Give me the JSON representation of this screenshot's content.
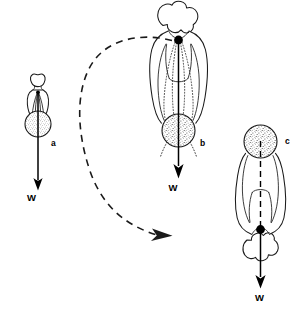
{
  "figure": {
    "background_color": "#ffffff",
    "ink_color": "#1a1a1a",
    "panels": [
      {
        "id": "a",
        "label": "a",
        "label_x": 51,
        "label_y": 146,
        "description": "small upright human figure, anterior view, center of mass at pelvis",
        "orientation": "upright",
        "vector_label": "W",
        "vector_label_x": 27,
        "vector_label_y": 201,
        "com_marker": "center-of-mass-dot",
        "stipple_region": "pelvis-center-of-mass"
      },
      {
        "id": "b",
        "label": "b",
        "label_x": 203,
        "label_y": 145,
        "description": "large upright human figure, head uppermost, center of mass at pelvis, rotation pivot dot at neck",
        "orientation": "upright",
        "vector_label": "W",
        "vector_label_x": 177,
        "vector_label_y": 190,
        "com_marker": "center-of-mass-dot",
        "stipple_region": "pelvis-center-of-mass"
      },
      {
        "id": "c",
        "label": "c",
        "label_x": 288,
        "label_y": 143,
        "description": "large inverted human figure, head lowermost, center of mass at pelvis uppermost, pivot dot at neck",
        "orientation": "inverted",
        "vector_label": "W",
        "vector_label_x": 259,
        "vector_label_y": 300,
        "com_marker": "center-of-mass-dot",
        "stipple_region": "pelvis-center-of-mass"
      }
    ],
    "rotation_arrow": {
      "name": "rotation-arrow",
      "style": "dashed-curved-arrow",
      "direction": "counterclockwise-then-rightward",
      "from_panel": "b",
      "to_panel": "c",
      "color": "#1a1a1a"
    },
    "colors": {
      "ink": "#1a1a1a",
      "vector": "#000000",
      "stipple_fill": "#d8d8d8",
      "paper": "#ffffff"
    }
  }
}
